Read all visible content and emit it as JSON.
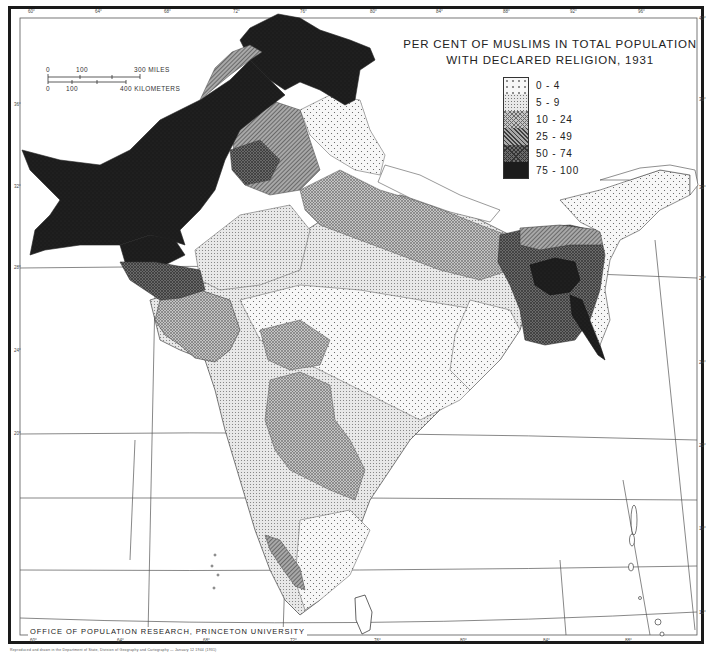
{
  "map": {
    "title_line1": "PER CENT OF MUSLIMS IN TOTAL POPULATION",
    "title_line2": "WITH DECLARED RELIGION, 1931",
    "subject": "Per cent of Muslims in total population with declared religion, 1931",
    "region": "British India (South Asia)",
    "legend": {
      "items": [
        {
          "label": "0 - 4",
          "pattern": "sparse-dots",
          "color": "#f4f4f4"
        },
        {
          "label": "5 - 9",
          "pattern": "dense-dots",
          "color": "#e2e2e2"
        },
        {
          "label": "10 - 24",
          "pattern": "crosshatch",
          "color": "#bdbdbd"
        },
        {
          "label": "25 - 49",
          "pattern": "diagonal-lines",
          "color": "#8e8e8e"
        },
        {
          "label": "50 - 74",
          "pattern": "dark-crosshatch",
          "color": "#5e5e5e"
        },
        {
          "label": "75 - 100",
          "pattern": "solid-dark",
          "color": "#1e1e1e"
        }
      ]
    },
    "scale_bar": {
      "miles_labels": [
        "0",
        "100",
        "300 MILES"
      ],
      "km_labels": [
        "0",
        "100",
        "400 KILOMETERS"
      ]
    },
    "credit": "OFFICE OF POPULATION RESEARCH, PRINCETON UNIVERSITY",
    "footer_note": "Reproduced and drawn in the Department of State, Division of Geography and Cartography  —  January 12 1944  (1931)",
    "graticule": {
      "top_ticks": [
        "60°",
        "64°",
        "68°",
        "72°",
        "76°",
        "80°",
        "84°",
        "88°",
        "92°",
        "96°"
      ],
      "bottom_ticks": [
        "60°",
        "64°",
        "68°",
        "72°",
        "76°",
        "80°",
        "84°",
        "88°",
        "92°"
      ],
      "left_ticks": [
        "36°",
        "32°",
        "28°",
        "24°",
        "20°",
        "16°",
        "12°",
        "8°"
      ],
      "right_ticks": [
        "40°",
        "36°",
        "32°",
        "28°",
        "24°",
        "20°",
        "16°",
        "12°",
        "8°"
      ]
    },
    "regions": [
      {
        "name": "North-West Frontier & Baluchistan",
        "class": "75 - 100"
      },
      {
        "name": "Kashmir (north)",
        "class": "75 - 100"
      },
      {
        "name": "West Punjab",
        "class": "50 - 74"
      },
      {
        "name": "Sind",
        "class": "75 - 100"
      },
      {
        "name": "East Bengal",
        "class": "75 - 100"
      },
      {
        "name": "Bengal (surrounding)",
        "class": "50 - 74"
      },
      {
        "name": "United Provinces",
        "class": "10 - 24"
      },
      {
        "name": "Rajputana",
        "class": "5 - 9"
      },
      {
        "name": "Central India",
        "class": "0 - 4"
      },
      {
        "name": "Hyderabad",
        "class": "10 - 24"
      },
      {
        "name": "Malabar coast",
        "class": "25 - 49"
      },
      {
        "name": "Madras Presidency",
        "class": "5 - 9"
      },
      {
        "name": "Assam hills",
        "class": "0 - 4"
      },
      {
        "name": "Himalayan hills (Kumaon/Kangra)",
        "class": "0 - 4"
      },
      {
        "name": "Gujarat / Kathiawar",
        "class": "10 - 24"
      }
    ]
  }
}
